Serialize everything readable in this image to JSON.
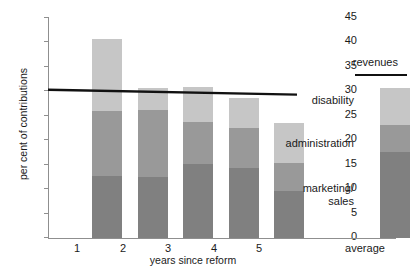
{
  "chart_data": {
    "type": "bar",
    "title": "",
    "subtitle": "",
    "xlabel": "years since reform",
    "ylabel": "per cent of contributions",
    "categories": [
      "1",
      "2",
      "3",
      "4",
      "5",
      "average"
    ],
    "stacked": true,
    "grid": false,
    "legend_position": "right-inline-annotations",
    "ylim": [
      0,
      45
    ],
    "yticks": [
      0,
      5,
      10,
      15,
      20,
      25,
      30,
      35,
      40,
      45
    ],
    "series": [
      {
        "name": "marketing/ sales",
        "color": "#808080",
        "values": [
          12.7,
          12.4,
          15.1,
          14.2,
          9.6,
          17.6
        ]
      },
      {
        "name": "administration",
        "color": "#999999",
        "values": [
          13.2,
          13.6,
          8.5,
          8.2,
          5.7,
          5.4
        ]
      },
      {
        "name": "disability",
        "color": "#c6c6c6",
        "values": [
          14.6,
          4.5,
          7.2,
          6.2,
          8.1,
          7.5
        ]
      }
    ],
    "totals": [
      40.5,
      30.5,
      30.8,
      28.6,
      23.4,
      30.5
    ],
    "overlay_line": {
      "name": "revenues",
      "color": "#111111",
      "x_start_category": "1",
      "x_end_category": "5",
      "y_start": 30.2,
      "y_end": 29.2
    },
    "annotations": [
      {
        "name": "revenues",
        "label": "revenues"
      },
      {
        "name": "disability",
        "label": "disability"
      },
      {
        "name": "administration",
        "label": "administration"
      },
      {
        "name": "marketing-sales",
        "label": "marketing/\nsales"
      }
    ]
  },
  "axes": {
    "y_label": "per cent of contributions",
    "x_label": "years since reform",
    "y_ticks": [
      "45",
      "40",
      "35",
      "30",
      "25",
      "20",
      "15",
      "10",
      "5",
      "0"
    ],
    "x_ticks": [
      "1",
      "2",
      "3",
      "4",
      "5",
      "average"
    ]
  },
  "labels": {
    "revenues": "revenues",
    "disability": "disability",
    "administration": "administration",
    "marketing_sales": "marketing/\nsales"
  },
  "colors": {
    "marketing_sales": "#808080",
    "administration": "#999999",
    "disability": "#c6c6c6",
    "revenue_line": "#111111",
    "axis": "#8f8f8f",
    "text": "#1a1a1a",
    "background": "#ffffff"
  }
}
